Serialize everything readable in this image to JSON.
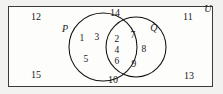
{
  "diagram": {
    "universe_label": "U",
    "sets": [
      {
        "id": "P",
        "label": "P",
        "label_x": 65,
        "label_y": 29
      },
      {
        "id": "Q",
        "label": "Q",
        "label_x": 154,
        "label_y": 28
      }
    ],
    "regions": {
      "p_only": {
        "name": "P only",
        "elements": [
          {
            "value": "1",
            "x": 82,
            "y": 38
          },
          {
            "value": "3",
            "x": 97,
            "y": 37
          },
          {
            "value": "5",
            "x": 86,
            "y": 59
          }
        ]
      },
      "intersection": {
        "name": "P intersect Q",
        "elements": [
          {
            "value": "2",
            "x": 117,
            "y": 39
          },
          {
            "value": "4",
            "x": 117,
            "y": 50
          },
          {
            "value": "6",
            "x": 117,
            "y": 61
          }
        ]
      },
      "q_only": {
        "name": "Q only",
        "elements": [
          {
            "value": "7",
            "x": 133,
            "y": 35
          },
          {
            "value": "8",
            "x": 144,
            "y": 49
          },
          {
            "value": "9",
            "x": 134,
            "y": 64
          }
        ]
      },
      "outside": {
        "name": "Outside both sets",
        "elements": [
          {
            "value": "12",
            "x": 36,
            "y": 17
          },
          {
            "value": "14",
            "x": 115,
            "y": 13
          },
          {
            "value": "11",
            "x": 188,
            "y": 17
          },
          {
            "value": "15",
            "x": 36,
            "y": 75
          },
          {
            "value": "10",
            "x": 113,
            "y": 80
          },
          {
            "value": "13",
            "x": 189,
            "y": 76
          }
        ]
      }
    },
    "geometry": {
      "circle_p": {
        "cx": 103,
        "cy": 47,
        "r": 34
      },
      "circle_q": {
        "cx": 136,
        "cy": 47,
        "r": 30
      },
      "rect": {
        "x": 8,
        "y": 6,
        "w": 205,
        "h": 81
      }
    },
    "colors": {
      "stroke": "#111111",
      "rect_border": "#3a3a3a",
      "rect_fill": "#fdfdfc",
      "page_background": "#f2f2f0",
      "text": "#1a1a1a"
    }
  }
}
